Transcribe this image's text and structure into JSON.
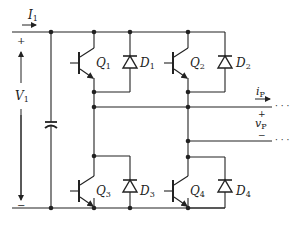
{
  "diagram": {
    "type": "circuit",
    "input": {
      "current_label": "I",
      "current_sub": "1",
      "voltage_label": "V",
      "voltage_sub": "1",
      "plus": "+",
      "minus": "−"
    },
    "transistors": [
      {
        "label": "Q",
        "sub": "1"
      },
      {
        "label": "Q",
        "sub": "2"
      },
      {
        "label": "Q",
        "sub": "3"
      },
      {
        "label": "Q",
        "sub": "4"
      }
    ],
    "diodes": [
      {
        "label": "D",
        "sub": "1"
      },
      {
        "label": "D",
        "sub": "2"
      },
      {
        "label": "D",
        "sub": "3"
      },
      {
        "label": "D",
        "sub": "4"
      }
    ],
    "output": {
      "current_label": "i",
      "current_sub": "P",
      "voltage_label": "v",
      "voltage_sub": "P",
      "plus": "+",
      "minus": "−",
      "continuation": "· · ·"
    },
    "colors": {
      "line": "#222222",
      "background": "#ffffff"
    }
  }
}
